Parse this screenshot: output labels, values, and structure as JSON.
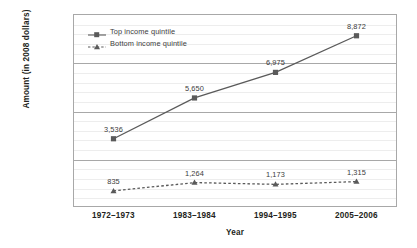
{
  "chart_data": {
    "type": "line",
    "title": "",
    "xlabel": "Year",
    "ylabel": "Amount (in 2008 dollars)",
    "categories": [
      "1972–1973",
      "1983–1984",
      "1994–1995",
      "2005–2006"
    ],
    "series": [
      {
        "name": "Top income quintile",
        "values": [
          3536,
          5650,
          6975,
          8872
        ],
        "value_labels": [
          "3,536",
          "5,650",
          "6,975",
          "8,872"
        ],
        "marker": "square",
        "linestyle": "solid",
        "color": "#5a5a5a"
      },
      {
        "name": "Bottom income quintile",
        "values": [
          835,
          1264,
          1173,
          1315
        ],
        "value_labels": [
          "835",
          "1,264",
          "1,173",
          "1,315"
        ],
        "marker": "triangle",
        "linestyle": "dashed",
        "color": "#5a5a5a"
      }
    ],
    "ylim": [
      0,
      10000
    ],
    "y_major_ticks": [
      0,
      2500,
      5000,
      7500,
      10000
    ],
    "y_tick_labels": [
      "$0",
      "$2500",
      "$5000",
      "$7500",
      "$10,000"
    ],
    "y_minor_interval": 500,
    "grid": true,
    "legend_position": "upper left"
  },
  "axis_colors": {
    "frame": "#a8a8a8",
    "major_grid": "#a8a8a8",
    "minor_grid": "#ededed",
    "text": "#231f20",
    "label_text": "#3b3b3b"
  }
}
